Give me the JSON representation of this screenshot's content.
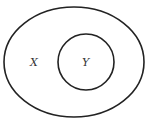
{
  "diagram": {
    "type": "venn-subset",
    "stroke_color": "#222222",
    "sets": [
      {
        "label": "X",
        "role": "outer"
      },
      {
        "label": "Y",
        "role": "inner"
      }
    ]
  }
}
